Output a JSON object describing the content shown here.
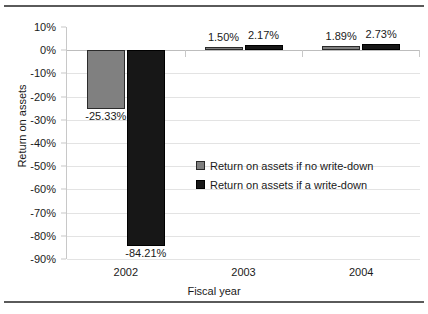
{
  "chart_data": {
    "type": "bar",
    "title": "",
    "xlabel": "Fiscal year",
    "ylabel": "Return on assets",
    "categories": [
      "2002",
      "2003",
      "2004"
    ],
    "series": [
      {
        "name": "Return on assets if no write-down",
        "color": "#808080",
        "values": [
          -25.33,
          1.5,
          1.89
        ],
        "labels": [
          "-25.33%",
          "1.50%",
          "1.89%"
        ]
      },
      {
        "name": "Return on assets if a write-down",
        "color": "#171717",
        "values": [
          -84.21,
          2.17,
          2.73
        ],
        "labels": [
          "-84.21%",
          "2.17%",
          "2.73%"
        ]
      }
    ],
    "ylim": [
      -90,
      10
    ],
    "yticks": [
      "10%",
      "0%",
      "-10%",
      "-20%",
      "-30%",
      "-40%",
      "-50%",
      "-60%",
      "-70%",
      "-80%",
      "-90%"
    ],
    "ytick_values": [
      10,
      0,
      -10,
      -20,
      -30,
      -40,
      -50,
      -60,
      -70,
      -80,
      -90
    ],
    "grid": true,
    "legend_position": "center"
  },
  "legend": {
    "items": [
      {
        "label": "Return on assets if no write-down"
      },
      {
        "label": "Return on assets if a write-down"
      }
    ]
  }
}
